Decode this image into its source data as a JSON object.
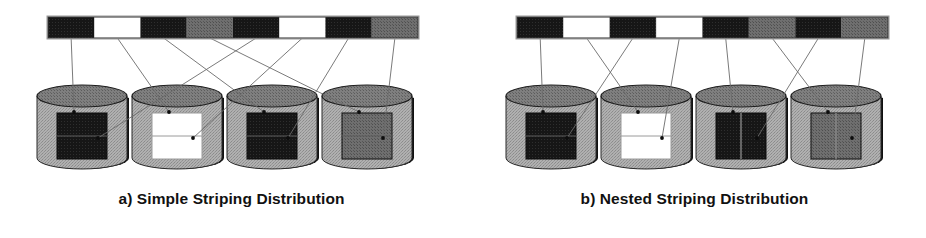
{
  "figure": {
    "background_color": "#ffffff",
    "width": 926,
    "height": 238,
    "line_color": "#6b6b6b",
    "outline_color": "#111111"
  },
  "palette": {
    "black": "#151515",
    "white": "#ffffff",
    "gray": "#7d7d7d",
    "dark_gray": "#6e6e6e",
    "cylinder_body": "#a9a9a9",
    "cylinder_top": "#7a7a7a",
    "cylinder_shadow": "#111111",
    "connector": "#6b6b6b"
  },
  "panels": [
    {
      "id": "a",
      "caption": "a) Simple Striping Distribution",
      "stripe_bar": {
        "name": "logical-data-stripe-bar",
        "x": 48,
        "y": 17,
        "width": 370,
        "height": 21,
        "segment_count": 8,
        "segments": [
          {
            "index": 1,
            "color": "black",
            "target_disk": 1
          },
          {
            "index": 2,
            "color": "white",
            "target_disk": 2
          },
          {
            "index": 3,
            "color": "black",
            "target_disk": 3
          },
          {
            "index": 4,
            "color": "gray",
            "target_disk": 4
          },
          {
            "index": 5,
            "color": "black",
            "target_disk": 1
          },
          {
            "index": 6,
            "color": "white",
            "target_disk": 2
          },
          {
            "index": 7,
            "color": "black",
            "target_disk": 3
          },
          {
            "index": 8,
            "color": "gray",
            "target_disk": 4
          }
        ]
      },
      "disks": [
        {
          "index": 1,
          "name": "disk-1",
          "cx": 82,
          "block_color": "black",
          "divider": "horizontal"
        },
        {
          "index": 2,
          "name": "disk-2",
          "cx": 177,
          "block_color": "white",
          "divider": "horizontal"
        },
        {
          "index": 3,
          "name": "disk-3",
          "cx": 272,
          "block_color": "black",
          "divider": "horizontal"
        },
        {
          "index": 4,
          "name": "disk-4",
          "cx": 367,
          "block_color": "dark_gray",
          "divider": "horizontal"
        }
      ],
      "connectors": [
        {
          "from_segment": 1,
          "to_disk": 1
        },
        {
          "from_segment": 2,
          "to_disk": 2
        },
        {
          "from_segment": 3,
          "to_disk": 3
        },
        {
          "from_segment": 4,
          "to_disk": 4
        },
        {
          "from_segment": 5,
          "to_disk": 1
        },
        {
          "from_segment": 6,
          "to_disk": 2
        },
        {
          "from_segment": 7,
          "to_disk": 3
        },
        {
          "from_segment": 8,
          "to_disk": 4
        }
      ]
    },
    {
      "id": "b",
      "caption": "b) Nested Striping Distribution",
      "stripe_bar": {
        "name": "logical-data-stripe-bar",
        "x": 517,
        "y": 17,
        "width": 371,
        "height": 21,
        "segment_count": 8,
        "segments": [
          {
            "index": 1,
            "color": "black",
            "target_disk": 1
          },
          {
            "index": 2,
            "color": "white",
            "target_disk": 2
          },
          {
            "index": 3,
            "color": "black",
            "target_disk": 1
          },
          {
            "index": 4,
            "color": "white",
            "target_disk": 2
          },
          {
            "index": 5,
            "color": "black",
            "target_disk": 3
          },
          {
            "index": 6,
            "color": "gray",
            "target_disk": 4
          },
          {
            "index": 7,
            "color": "black",
            "target_disk": 3
          },
          {
            "index": 8,
            "color": "gray",
            "target_disk": 4
          }
        ]
      },
      "disks": [
        {
          "index": 1,
          "name": "disk-1",
          "cx": 551,
          "block_color": "black",
          "divider": "horizontal"
        },
        {
          "index": 2,
          "name": "disk-2",
          "cx": 646,
          "block_color": "white",
          "divider": "horizontal"
        },
        {
          "index": 3,
          "name": "disk-3",
          "cx": 741,
          "block_color": "black",
          "divider": "vertical"
        },
        {
          "index": 4,
          "name": "disk-4",
          "cx": 836,
          "block_color": "dark_gray",
          "divider": "vertical"
        }
      ],
      "connectors": [
        {
          "from_segment": 1,
          "to_disk": 1
        },
        {
          "from_segment": 2,
          "to_disk": 2
        },
        {
          "from_segment": 3,
          "to_disk": 1
        },
        {
          "from_segment": 4,
          "to_disk": 2
        },
        {
          "from_segment": 5,
          "to_disk": 3
        },
        {
          "from_segment": 6,
          "to_disk": 4
        },
        {
          "from_segment": 7,
          "to_disk": 3
        },
        {
          "from_segment": 8,
          "to_disk": 4
        }
      ]
    }
  ]
}
